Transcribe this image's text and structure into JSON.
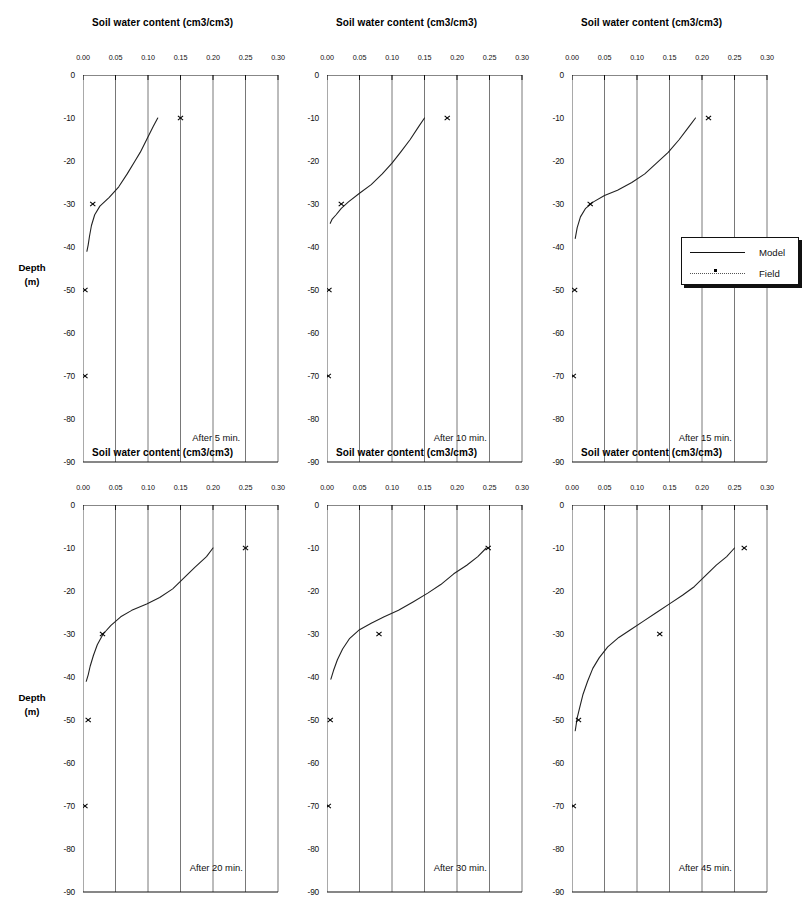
{
  "figure": {
    "x_axis_title": "Soil water content (cm3/cm3)",
    "y_axis_title_line1": "Depth",
    "y_axis_title_line2": "(m)",
    "x_ticks": [
      "0.00",
      "0.05",
      "0.10",
      "0.15",
      "0.20",
      "0.25",
      "0.30"
    ],
    "y_ticks": [
      "0",
      "-10",
      "-20",
      "-30",
      "-40",
      "-50",
      "-60",
      "-70",
      "-80",
      "-90"
    ],
    "legend": {
      "model_label": "Model",
      "field_label": "Field",
      "model_style": "solid-line",
      "field_style": "dotted-line-with-marker"
    },
    "colors": {
      "axis": "#111111",
      "grid": "#555555",
      "model_line": "#222222",
      "field_marker": "#000000",
      "background": "#ffffff"
    }
  },
  "chart_data": {
    "type": "line",
    "xlabel": "Soil water content (cm3/cm3)",
    "ylabel": "Depth (m)",
    "xlim": [
      0.0,
      0.3
    ],
    "ylim": [
      -90,
      0
    ],
    "xticks": [
      0.0,
      0.05,
      0.1,
      0.15,
      0.2,
      0.25,
      0.3
    ],
    "yticks": [
      0,
      -10,
      -20,
      -30,
      -40,
      -50,
      -60,
      -70,
      -80,
      -90
    ],
    "grid": "vertical-only",
    "legend_position": "right-of-panel-3",
    "legend_entries": [
      "Model",
      "Field"
    ],
    "panels": [
      {
        "caption": "After 5 min.",
        "series": [
          {
            "name": "Model",
            "style": "line",
            "points": [
              {
                "theta": 0.115,
                "depth": -10.0
              },
              {
                "theta": 0.108,
                "depth": -12.0
              },
              {
                "theta": 0.098,
                "depth": -15.0
              },
              {
                "theta": 0.088,
                "depth": -18.0
              },
              {
                "theta": 0.08,
                "depth": -20.0
              },
              {
                "theta": 0.068,
                "depth": -23.0
              },
              {
                "theta": 0.055,
                "depth": -26.0
              },
              {
                "theta": 0.04,
                "depth": -28.5
              },
              {
                "theta": 0.026,
                "depth": -30.5
              },
              {
                "theta": 0.018,
                "depth": -32.5
              },
              {
                "theta": 0.013,
                "depth": -35.0
              },
              {
                "theta": 0.01,
                "depth": -37.5
              },
              {
                "theta": 0.008,
                "depth": -39.5
              },
              {
                "theta": 0.006,
                "depth": -41.0
              }
            ]
          },
          {
            "name": "Field",
            "style": "markers",
            "points": [
              {
                "theta": 0.15,
                "depth": -10
              },
              {
                "theta": 0.015,
                "depth": -30
              },
              {
                "theta": 0.003,
                "depth": -50
              },
              {
                "theta": 0.003,
                "depth": -70
              }
            ]
          }
        ]
      },
      {
        "caption": "After 10 min.",
        "series": [
          {
            "name": "Model",
            "style": "line",
            "points": [
              {
                "theta": 0.15,
                "depth": -10.0
              },
              {
                "theta": 0.141,
                "depth": -12.0
              },
              {
                "theta": 0.128,
                "depth": -15.0
              },
              {
                "theta": 0.113,
                "depth": -18.0
              },
              {
                "theta": 0.1,
                "depth": -20.5
              },
              {
                "theta": 0.085,
                "depth": -23.0
              },
              {
                "theta": 0.068,
                "depth": -25.5
              },
              {
                "theta": 0.05,
                "depth": -27.5
              },
              {
                "theta": 0.033,
                "depth": -29.5
              },
              {
                "theta": 0.022,
                "depth": -31.0
              },
              {
                "theta": 0.014,
                "depth": -32.5
              },
              {
                "theta": 0.008,
                "depth": -33.5
              },
              {
                "theta": 0.005,
                "depth": -34.5
              }
            ]
          },
          {
            "name": "Field",
            "style": "markers",
            "points": [
              {
                "theta": 0.185,
                "depth": -10
              },
              {
                "theta": 0.022,
                "depth": -30
              },
              {
                "theta": 0.003,
                "depth": -50
              },
              {
                "theta": 0.002,
                "depth": -70
              }
            ]
          }
        ]
      },
      {
        "caption": "After 15 min.",
        "series": [
          {
            "name": "Model",
            "style": "line",
            "points": [
              {
                "theta": 0.19,
                "depth": -10.0
              },
              {
                "theta": 0.18,
                "depth": -12.0
              },
              {
                "theta": 0.165,
                "depth": -15.0
              },
              {
                "theta": 0.148,
                "depth": -18.0
              },
              {
                "theta": 0.13,
                "depth": -20.5
              },
              {
                "theta": 0.112,
                "depth": -23.0
              },
              {
                "theta": 0.092,
                "depth": -25.0
              },
              {
                "theta": 0.07,
                "depth": -26.8
              },
              {
                "theta": 0.05,
                "depth": -28.0
              },
              {
                "theta": 0.033,
                "depth": -29.5
              },
              {
                "theta": 0.021,
                "depth": -31.0
              },
              {
                "theta": 0.013,
                "depth": -33.0
              },
              {
                "theta": 0.008,
                "depth": -35.5
              },
              {
                "theta": 0.005,
                "depth": -38.0
              }
            ]
          },
          {
            "name": "Field",
            "style": "markers",
            "points": [
              {
                "theta": 0.21,
                "depth": -10
              },
              {
                "theta": 0.028,
                "depth": -30
              },
              {
                "theta": 0.004,
                "depth": -50
              },
              {
                "theta": 0.002,
                "depth": -70
              }
            ]
          }
        ]
      },
      {
        "caption": "After 20 min.",
        "series": [
          {
            "name": "Model",
            "style": "line",
            "points": [
              {
                "theta": 0.2,
                "depth": -10.0
              },
              {
                "theta": 0.19,
                "depth": -12.0
              },
              {
                "theta": 0.172,
                "depth": -14.5
              },
              {
                "theta": 0.155,
                "depth": -17.0
              },
              {
                "theta": 0.138,
                "depth": -19.5
              },
              {
                "theta": 0.118,
                "depth": -21.5
              },
              {
                "theta": 0.098,
                "depth": -23.0
              },
              {
                "theta": 0.075,
                "depth": -24.5
              },
              {
                "theta": 0.058,
                "depth": -26.0
              },
              {
                "theta": 0.043,
                "depth": -28.0
              },
              {
                "theta": 0.031,
                "depth": -30.0
              },
              {
                "theta": 0.022,
                "depth": -32.5
              },
              {
                "theta": 0.016,
                "depth": -35.0
              },
              {
                "theta": 0.011,
                "depth": -37.5
              },
              {
                "theta": 0.008,
                "depth": -39.5
              },
              {
                "theta": 0.005,
                "depth": -41.0
              }
            ]
          },
          {
            "name": "Field",
            "style": "markers",
            "points": [
              {
                "theta": 0.25,
                "depth": -10
              },
              {
                "theta": 0.03,
                "depth": -30
              },
              {
                "theta": 0.008,
                "depth": -50
              },
              {
                "theta": 0.003,
                "depth": -70
              }
            ]
          }
        ]
      },
      {
        "caption": "After 30 min.",
        "series": [
          {
            "name": "Model",
            "style": "line",
            "points": [
              {
                "theta": 0.245,
                "depth": -10.0
              },
              {
                "theta": 0.232,
                "depth": -12.0
              },
              {
                "theta": 0.215,
                "depth": -14.0
              },
              {
                "theta": 0.195,
                "depth": -16.0
              },
              {
                "theta": 0.175,
                "depth": -18.5
              },
              {
                "theta": 0.155,
                "depth": -20.5
              },
              {
                "theta": 0.133,
                "depth": -22.5
              },
              {
                "theta": 0.11,
                "depth": -24.5
              },
              {
                "theta": 0.088,
                "depth": -26.0
              },
              {
                "theta": 0.068,
                "depth": -27.5
              },
              {
                "theta": 0.05,
                "depth": -29.0
              },
              {
                "theta": 0.035,
                "depth": -31.0
              },
              {
                "theta": 0.024,
                "depth": -33.5
              },
              {
                "theta": 0.016,
                "depth": -36.0
              },
              {
                "theta": 0.01,
                "depth": -38.5
              },
              {
                "theta": 0.006,
                "depth": -40.5
              }
            ]
          },
          {
            "name": "Field",
            "style": "markers",
            "points": [
              {
                "theta": 0.248,
                "depth": -10
              },
              {
                "theta": 0.08,
                "depth": -30
              },
              {
                "theta": 0.005,
                "depth": -50
              },
              {
                "theta": 0.002,
                "depth": -70
              }
            ]
          }
        ]
      },
      {
        "caption": "After 45 min.",
        "series": [
          {
            "name": "Model",
            "style": "line",
            "points": [
              {
                "theta": 0.25,
                "depth": -10.0
              },
              {
                "theta": 0.238,
                "depth": -12.0
              },
              {
                "theta": 0.222,
                "depth": -14.0
              },
              {
                "theta": 0.205,
                "depth": -16.5
              },
              {
                "theta": 0.188,
                "depth": -19.0
              },
              {
                "theta": 0.17,
                "depth": -21.0
              },
              {
                "theta": 0.15,
                "depth": -23.0
              },
              {
                "theta": 0.13,
                "depth": -25.0
              },
              {
                "theta": 0.11,
                "depth": -27.0
              },
              {
                "theta": 0.09,
                "depth": -29.0
              },
              {
                "theta": 0.072,
                "depth": -30.8
              },
              {
                "theta": 0.055,
                "depth": -33.0
              },
              {
                "theta": 0.042,
                "depth": -35.5
              },
              {
                "theta": 0.032,
                "depth": -38.0
              },
              {
                "theta": 0.024,
                "depth": -41.0
              },
              {
                "theta": 0.017,
                "depth": -44.0
              },
              {
                "theta": 0.012,
                "depth": -47.0
              },
              {
                "theta": 0.008,
                "depth": -49.5
              },
              {
                "theta": 0.005,
                "depth": -52.5
              }
            ]
          },
          {
            "name": "Field",
            "style": "markers",
            "points": [
              {
                "theta": 0.265,
                "depth": -10
              },
              {
                "theta": 0.135,
                "depth": -30
              },
              {
                "theta": 0.01,
                "depth": -50
              },
              {
                "theta": 0.002,
                "depth": -70
              }
            ]
          }
        ]
      }
    ]
  }
}
